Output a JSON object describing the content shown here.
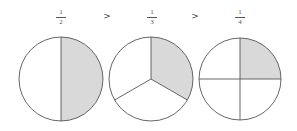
{
  "diagram": {
    "fractions": [
      {
        "numerator": "1",
        "denominator": "2",
        "label": "1/2",
        "parts": 2,
        "shaded": 1
      },
      {
        "numerator": "1",
        "denominator": "3",
        "label": "1/3",
        "parts": 3,
        "shaded": 1
      },
      {
        "numerator": "1",
        "denominator": "4",
        "label": "1/4",
        "parts": 4,
        "shaded": 1
      }
    ],
    "comparators": [
      ">",
      ">"
    ],
    "colors": {
      "shade": "#d9d9d9",
      "stroke": "#555555",
      "background": "#ffffff"
    }
  }
}
